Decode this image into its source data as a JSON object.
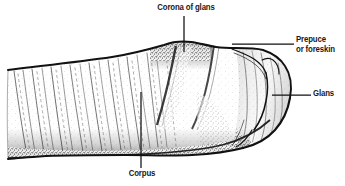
{
  "figure": {
    "type": "anatomical-line-drawing",
    "background_color": "#ffffff",
    "ink_color": "#111111",
    "labels": [
      {
        "id": "corona",
        "text": "Corona of glans",
        "position": "top-center",
        "leader": "vertical-down"
      },
      {
        "id": "prepuce",
        "line1": "Prepuce",
        "line2": "or foreskin",
        "position": "right-upper",
        "leader": "horizontal-left"
      },
      {
        "id": "glans",
        "text": "Glans",
        "position": "right-middle",
        "leader": "horizontal-left"
      },
      {
        "id": "corpus",
        "text": "Corpus",
        "position": "bottom-center",
        "leader": "vertical-up"
      }
    ]
  }
}
